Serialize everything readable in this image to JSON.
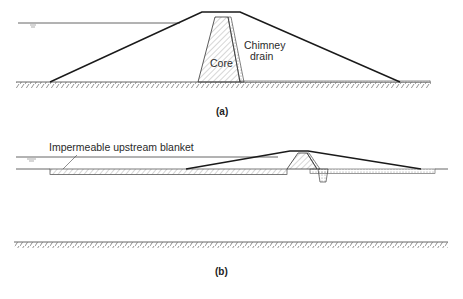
{
  "figure": {
    "panel_a": {
      "caption": "(a)",
      "labels": {
        "core": "Core",
        "chimney_drain_line1": "Chimney",
        "chimney_drain_line2": "drain"
      }
    },
    "panel_b": {
      "caption": "(b)",
      "labels": {
        "blanket": "Impermeable upstream blanket"
      }
    },
    "colors": {
      "line": "#1a1a1a",
      "hatch": "#6a6a6a",
      "background": "#ffffff"
    }
  }
}
